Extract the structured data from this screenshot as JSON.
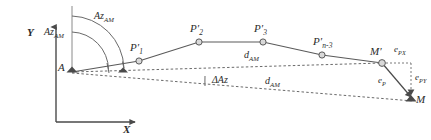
{
  "figure": {
    "type": "geodetic-traverse-error-diagram",
    "stroke_color": "#4a4a4a",
    "text_color": "#2b2b2b",
    "node_fill": "#d9d9d9"
  },
  "axes": {
    "y_label": "Y",
    "x_label": "X"
  },
  "nodes": {
    "a": {
      "label": "A"
    },
    "p1": {
      "label": "P",
      "prime": "′",
      "sub": "1"
    },
    "p2": {
      "label": "P",
      "prime": "′",
      "sub": "2"
    },
    "p3": {
      "label": "P",
      "prime": "′",
      "sub": "3"
    },
    "pn3": {
      "label": "P",
      "prime": "′",
      "sub": "n-3"
    },
    "mprime": {
      "label": "M",
      "prime": "′"
    },
    "m": {
      "label": "M"
    }
  },
  "azimuths": {
    "outer": {
      "label": "Az",
      "sub": "AM"
    },
    "inner": {
      "label": "Az",
      "sub": "AM"
    },
    "delta": {
      "label": "ΔAz"
    }
  },
  "distances": {
    "upper": {
      "label": "d",
      "sub": "AM"
    },
    "lower": {
      "label": "d",
      "sub": "AM"
    }
  },
  "errors": {
    "px": {
      "label": "e",
      "sub": "PX"
    },
    "py": {
      "label": "e",
      "sub": "PY"
    },
    "p": {
      "label": "e",
      "sub": "P"
    }
  }
}
